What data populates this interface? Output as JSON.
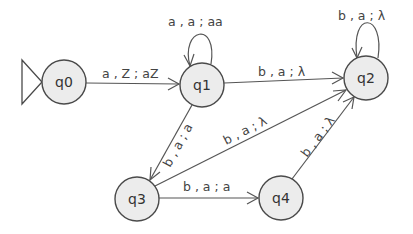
{
  "diagram": {
    "type": "pushdown-automaton",
    "start_state": "q0",
    "states": [
      {
        "id": "q0",
        "label": "q0",
        "x": 64,
        "y": 82
      },
      {
        "id": "q1",
        "label": "q1",
        "x": 202,
        "y": 85
      },
      {
        "id": "q2",
        "label": "q2",
        "x": 366,
        "y": 78
      },
      {
        "id": "q3",
        "label": "q3",
        "x": 137,
        "y": 199
      },
      {
        "id": "q4",
        "label": "q4",
        "x": 281,
        "y": 198
      }
    ],
    "transitions": [
      {
        "from": "q0",
        "to": "q1",
        "label": "a , Z ; aZ"
      },
      {
        "from": "q1",
        "to": "q1",
        "label": "a , a ; aa"
      },
      {
        "from": "q1",
        "to": "q2",
        "label": "b , a ; λ"
      },
      {
        "from": "q2",
        "to": "q2",
        "label": "b , a ; λ"
      },
      {
        "from": "q1",
        "to": "q3",
        "label": "b , a ; a"
      },
      {
        "from": "q3",
        "to": "q2",
        "label": "b , a ; λ"
      },
      {
        "from": "q3",
        "to": "q4",
        "label": "b , a ; a"
      },
      {
        "from": "q4",
        "to": "q2",
        "label": "b , a ; λ"
      }
    ]
  },
  "colors": {
    "state_fill": "#ececec",
    "state_stroke": "#4a4a4a",
    "edge": "#555555"
  }
}
